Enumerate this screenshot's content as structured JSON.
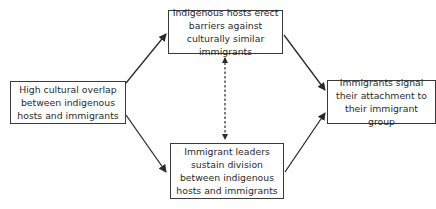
{
  "diagram": {
    "nodes": [
      {
        "id": "cause",
        "text": "High cultural overlap between indigenous hosts and immigrants"
      },
      {
        "id": "hosts",
        "text": "Indigenous hosts erect barriers against culturally similar immigrants"
      },
      {
        "id": "leaders",
        "text": "Immigrant leaders sustain division between indigenous hosts and immigrants"
      },
      {
        "id": "outcome",
        "text": "Immigrants signal their attachment to their immigrant group"
      }
    ],
    "edges": [
      {
        "from": "cause",
        "to": "hosts",
        "style": "solid"
      },
      {
        "from": "cause",
        "to": "leaders",
        "style": "solid"
      },
      {
        "from": "hosts",
        "to": "outcome",
        "style": "solid"
      },
      {
        "from": "leaders",
        "to": "outcome",
        "style": "solid"
      },
      {
        "from": "hosts",
        "to": "leaders",
        "style": "dashed",
        "bidirectional": true
      }
    ],
    "colors": {
      "line": "#2a2a2a",
      "text": "#2a2a2a",
      "background": "#ffffff"
    }
  }
}
